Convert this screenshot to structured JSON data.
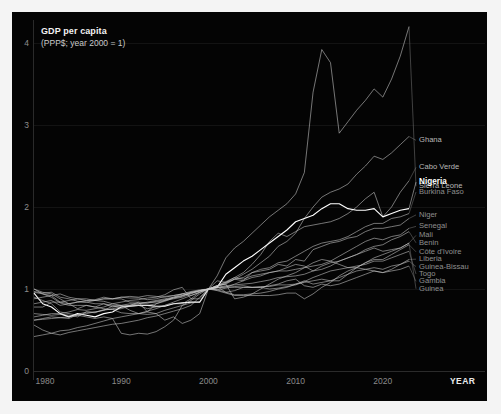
{
  "figure": {
    "title": "GDP per capita",
    "subtitle": "(PPP$; year 2000 = 1)",
    "x_axis_name": "YEAR",
    "background_color": "#040404",
    "frame_color": "#f4f4f4",
    "line_color": "#c8c8c8",
    "highlight_color": "#ffffff"
  },
  "chart_data": {
    "type": "line",
    "title": "GDP per capita",
    "subtitle": "(PPP$; year 2000 = 1)",
    "xlabel": "YEAR",
    "ylabel": "",
    "xlim": [
      1980,
      2023
    ],
    "ylim": [
      0,
      4.4
    ],
    "xticks": [
      1980,
      1990,
      2000,
      2010,
      2020
    ],
    "yticks": [
      0,
      1,
      2,
      3,
      4
    ],
    "grid": true,
    "legend": "inline-right-labels",
    "normalization": "year 2000 = 1",
    "x": [
      1980,
      1981,
      1982,
      1983,
      1984,
      1985,
      1986,
      1987,
      1988,
      1989,
      1990,
      1991,
      1992,
      1993,
      1994,
      1995,
      1996,
      1997,
      1998,
      1999,
      2000,
      2001,
      2002,
      2003,
      2004,
      2005,
      2006,
      2007,
      2008,
      2009,
      2010,
      2011,
      2012,
      2013,
      2014,
      2015,
      2016,
      2017,
      2018,
      2019,
      2020,
      2021,
      2022,
      2023
    ],
    "series": [
      {
        "name": "Sierra Leone",
        "highlight": false,
        "label_y": 2.29,
        "values": [
          0.97,
          0.95,
          0.96,
          0.9,
          0.88,
          0.85,
          0.84,
          0.86,
          0.85,
          0.82,
          0.8,
          0.74,
          0.7,
          0.72,
          0.7,
          0.62,
          0.66,
          0.58,
          0.62,
          0.7,
          1.0,
          1.16,
          1.38,
          1.5,
          1.58,
          1.68,
          1.78,
          1.88,
          1.96,
          2.04,
          2.16,
          2.42,
          3.4,
          3.92,
          3.76,
          2.9,
          3.04,
          3.18,
          3.3,
          3.44,
          3.34,
          3.56,
          3.84,
          4.2
        ]
      },
      {
        "name": "Ghana",
        "highlight": false,
        "label_y": 2.85,
        "values": [
          0.56,
          0.5,
          0.46,
          0.44,
          0.47,
          0.49,
          0.51,
          0.53,
          0.55,
          0.57,
          0.58,
          0.6,
          0.62,
          0.65,
          0.67,
          0.7,
          0.73,
          0.76,
          0.8,
          0.9,
          1.0,
          1.03,
          1.07,
          1.12,
          1.18,
          1.24,
          1.32,
          1.4,
          1.52,
          1.58,
          1.68,
          1.86,
          2.0,
          2.12,
          2.18,
          2.22,
          2.28,
          2.4,
          2.5,
          2.62,
          2.58,
          2.66,
          2.76,
          2.86
        ]
      },
      {
        "name": "Cabo Verde",
        "highlight": false,
        "label_y": 2.52,
        "values": [
          0.42,
          0.44,
          0.46,
          0.49,
          0.5,
          0.53,
          0.55,
          0.58,
          0.61,
          0.64,
          0.66,
          0.68,
          0.7,
          0.73,
          0.76,
          0.8,
          0.84,
          0.88,
          0.92,
          0.96,
          1.0,
          1.04,
          1.09,
          1.14,
          1.2,
          1.3,
          1.42,
          1.58,
          1.68,
          1.64,
          1.7,
          1.76,
          1.78,
          1.8,
          1.82,
          1.86,
          1.92,
          2.0,
          2.1,
          2.18,
          1.88,
          2.0,
          2.18,
          2.32
        ]
      },
      {
        "name": "Nigeria",
        "highlight": true,
        "label_y": 2.34,
        "values": [
          0.95,
          0.82,
          0.78,
          0.7,
          0.66,
          0.7,
          0.68,
          0.66,
          0.7,
          0.72,
          0.78,
          0.79,
          0.8,
          0.8,
          0.79,
          0.79,
          0.82,
          0.83,
          0.84,
          0.84,
          1.0,
          1.02,
          1.18,
          1.26,
          1.34,
          1.4,
          1.48,
          1.56,
          1.64,
          1.72,
          1.82,
          1.86,
          1.9,
          1.98,
          2.04,
          2.04,
          1.98,
          1.96,
          1.96,
          1.98,
          1.88,
          1.92,
          1.96,
          1.98
        ]
      },
      {
        "name": "Burkina Faso",
        "highlight": false,
        "label_y": 2.22,
        "values": [
          0.62,
          0.64,
          0.66,
          0.65,
          0.64,
          0.69,
          0.72,
          0.71,
          0.75,
          0.75,
          0.76,
          0.79,
          0.8,
          0.8,
          0.82,
          0.85,
          0.89,
          0.91,
          0.96,
          0.98,
          1.0,
          1.04,
          1.06,
          1.12,
          1.14,
          1.2,
          1.24,
          1.26,
          1.32,
          1.34,
          1.4,
          1.46,
          1.52,
          1.56,
          1.58,
          1.6,
          1.64,
          1.7,
          1.76,
          1.8,
          1.8,
          1.86,
          1.88,
          1.92
        ]
      },
      {
        "name": "Niger",
        "highlight": false,
        "label_y": 1.94,
        "values": [
          1.0,
          0.96,
          0.94,
          0.88,
          0.82,
          0.76,
          0.8,
          0.78,
          0.82,
          0.8,
          0.8,
          0.8,
          0.8,
          0.76,
          0.78,
          0.8,
          0.82,
          0.82,
          0.88,
          0.88,
          1.0,
          1.04,
          1.08,
          1.12,
          1.1,
          1.2,
          1.22,
          1.24,
          1.3,
          1.28,
          1.36,
          1.34,
          1.48,
          1.52,
          1.56,
          1.58,
          1.62,
          1.64,
          1.7,
          1.74,
          1.74,
          1.76,
          1.78,
          1.86
        ]
      },
      {
        "name": "Senegal",
        "highlight": false,
        "label_y": 1.8,
        "values": [
          0.78,
          0.78,
          0.84,
          0.84,
          0.82,
          0.84,
          0.86,
          0.87,
          0.9,
          0.88,
          0.9,
          0.89,
          0.89,
          0.87,
          0.88,
          0.91,
          0.92,
          0.94,
          0.97,
          0.99,
          1.0,
          1.02,
          1.02,
          1.06,
          1.1,
          1.14,
          1.16,
          1.2,
          1.22,
          1.22,
          1.24,
          1.26,
          1.28,
          1.3,
          1.34,
          1.4,
          1.46,
          1.52,
          1.58,
          1.62,
          1.6,
          1.64,
          1.66,
          1.74
        ]
      },
      {
        "name": "Mali",
        "highlight": false,
        "label_y": 1.69,
        "values": [
          0.7,
          0.69,
          0.68,
          0.69,
          0.68,
          0.66,
          0.72,
          0.72,
          0.74,
          0.79,
          0.78,
          0.8,
          0.84,
          0.83,
          0.84,
          0.86,
          0.88,
          0.9,
          0.94,
          0.98,
          1.0,
          1.1,
          1.08,
          1.14,
          1.12,
          1.16,
          1.18,
          1.2,
          1.22,
          1.26,
          1.3,
          1.28,
          1.22,
          1.24,
          1.28,
          1.34,
          1.38,
          1.42,
          1.46,
          1.5,
          1.46,
          1.48,
          1.5,
          1.56
        ]
      },
      {
        "name": "Benin",
        "highlight": false,
        "label_y": 1.6,
        "values": [
          0.82,
          0.84,
          0.86,
          0.8,
          0.82,
          0.84,
          0.84,
          0.82,
          0.82,
          0.78,
          0.8,
          0.82,
          0.82,
          0.83,
          0.85,
          0.87,
          0.89,
          0.92,
          0.95,
          0.98,
          1.0,
          1.02,
          1.04,
          1.05,
          1.06,
          1.07,
          1.09,
          1.11,
          1.14,
          1.15,
          1.16,
          1.18,
          1.22,
          1.28,
          1.32,
          1.34,
          1.38,
          1.42,
          1.48,
          1.52,
          1.54,
          1.6,
          1.64,
          1.7
        ]
      },
      {
        "name": "Côte d'Ivoire",
        "highlight": false,
        "label_y": 1.49,
        "values": [
          1.0,
          0.94,
          0.9,
          0.83,
          0.8,
          0.8,
          0.8,
          0.78,
          0.76,
          0.75,
          0.71,
          0.7,
          0.7,
          0.69,
          0.7,
          0.74,
          0.77,
          0.8,
          0.83,
          0.84,
          1.0,
          0.98,
          0.95,
          0.92,
          0.92,
          0.92,
          0.92,
          0.92,
          0.93,
          0.95,
          0.95,
          0.88,
          0.94,
          1.02,
          1.08,
          1.16,
          1.22,
          1.26,
          1.32,
          1.36,
          1.36,
          1.42,
          1.48,
          1.54
        ]
      },
      {
        "name": "Liberia",
        "highlight": false,
        "label_y": 1.4,
        "values": [
          0.9,
          0.86,
          0.82,
          0.72,
          0.7,
          0.68,
          0.66,
          0.64,
          0.66,
          0.64,
          0.46,
          0.44,
          0.46,
          0.45,
          0.48,
          0.54,
          0.62,
          0.8,
          0.86,
          0.94,
          1.0,
          1.04,
          1.06,
          0.88,
          0.9,
          0.94,
          1.0,
          1.06,
          1.12,
          1.16,
          1.2,
          1.26,
          1.32,
          1.36,
          1.34,
          1.3,
          1.26,
          1.26,
          1.24,
          1.22,
          1.2,
          1.24,
          1.3,
          1.36
        ]
      },
      {
        "name": "Guinea-Bissau",
        "highlight": false,
        "label_y": 1.31,
        "values": [
          0.66,
          0.68,
          0.7,
          0.7,
          0.72,
          0.75,
          0.74,
          0.76,
          0.78,
          0.82,
          0.84,
          0.86,
          0.87,
          0.89,
          0.9,
          0.93,
          0.99,
          1.02,
          0.88,
          0.96,
          1.0,
          0.99,
          0.96,
          0.93,
          0.93,
          0.94,
          0.95,
          0.97,
          1.0,
          1.02,
          1.06,
          1.1,
          1.06,
          1.08,
          1.1,
          1.14,
          1.18,
          1.22,
          1.24,
          1.26,
          1.24,
          1.28,
          1.3,
          1.34
        ]
      },
      {
        "name": "Togo",
        "highlight": false,
        "label_y": 1.22,
        "values": [
          0.96,
          0.94,
          0.92,
          0.84,
          0.86,
          0.88,
          0.88,
          0.86,
          0.88,
          0.88,
          0.88,
          0.84,
          0.84,
          0.72,
          0.82,
          0.86,
          0.9,
          0.94,
          0.92,
          0.96,
          1.0,
          0.99,
          1.01,
          1.03,
          1.04,
          1.02,
          1.02,
          1.0,
          1.01,
          1.03,
          1.05,
          1.09,
          1.14,
          1.18,
          1.22,
          1.24,
          1.26,
          1.28,
          1.3,
          1.34,
          1.34,
          1.38,
          1.42,
          1.46
        ]
      },
      {
        "name": "Gambia",
        "highlight": false,
        "label_y": 1.13,
        "values": [
          0.88,
          0.9,
          0.92,
          0.94,
          0.9,
          0.88,
          0.86,
          0.86,
          0.88,
          0.88,
          0.9,
          0.91,
          0.9,
          0.92,
          0.91,
          0.9,
          0.92,
          0.94,
          0.96,
          0.98,
          1.0,
          1.03,
          0.96,
          0.98,
          1.02,
          1.02,
          1.02,
          1.04,
          1.06,
          1.1,
          1.12,
          1.04,
          1.02,
          1.06,
          1.04,
          1.06,
          1.1,
          1.14,
          1.18,
          1.22,
          1.2,
          1.22,
          1.24,
          1.28
        ]
      },
      {
        "name": "Guinea",
        "highlight": false,
        "label_y": 1.04,
        "values": [
          0.62,
          0.63,
          0.64,
          0.65,
          0.66,
          0.68,
          0.7,
          0.72,
          0.74,
          0.76,
          0.78,
          0.8,
          0.82,
          0.84,
          0.86,
          0.88,
          0.9,
          0.92,
          0.95,
          0.97,
          1.0,
          1.01,
          1.03,
          1.02,
          1.02,
          1.02,
          1.03,
          1.03,
          1.05,
          1.05,
          1.06,
          1.08,
          1.1,
          1.12,
          1.1,
          1.1,
          1.18,
          1.26,
          1.32,
          1.38,
          1.42,
          1.46,
          1.5,
          1.56
        ]
      }
    ]
  },
  "y_ticks": [
    {
      "value": 4,
      "label": "4"
    },
    {
      "value": 3,
      "label": "3"
    },
    {
      "value": 2,
      "label": "2"
    },
    {
      "value": 1,
      "label": "1"
    },
    {
      "value": 0,
      "label": "0"
    }
  ],
  "x_ticks": [
    {
      "value": 1980,
      "label": "1980"
    },
    {
      "value": 1990,
      "label": "1990"
    },
    {
      "value": 2000,
      "label": "2000"
    },
    {
      "value": 2010,
      "label": "2010"
    },
    {
      "value": 2020,
      "label": "2020"
    }
  ]
}
